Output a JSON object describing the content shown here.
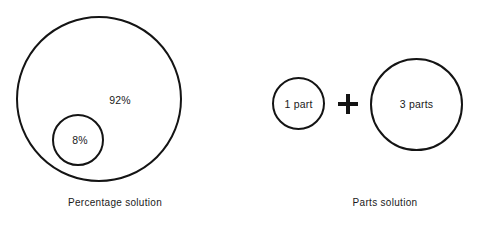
{
  "figure": {
    "width": 485,
    "height": 225,
    "background_color": "#ffffff",
    "stroke_color": "#141414",
    "text_color": "#1a1a1a"
  },
  "chart_data": {
    "type": "diagram",
    "title": "",
    "subtitle": "",
    "xlabel": "",
    "ylabel": "",
    "grid": false,
    "legend_position": "none",
    "panels": [
      {
        "name": "percentage-solution",
        "caption": "Percentage solution",
        "shapes": [
          {
            "name": "solution-outer-circle",
            "label": "92%",
            "value": 92,
            "unit": "%",
            "role": "solvent-plus-solute-whole",
            "center": [
              99,
              99
            ],
            "radius": 83
          },
          {
            "name": "solute-inner-circle",
            "label": "8%",
            "value": 8,
            "unit": "%",
            "role": "solute-part",
            "center": [
              78,
              140
            ],
            "radius": 26
          }
        ]
      },
      {
        "name": "parts-solution",
        "caption": "Parts solution",
        "operator": "+",
        "shapes": [
          {
            "name": "one-part-circle",
            "label": "1 part",
            "value": 1,
            "unit": "part",
            "role": "solute-part",
            "center": [
              298,
              103
            ],
            "radius": 26
          },
          {
            "name": "three-parts-circle",
            "label": "3 parts",
            "value": 3,
            "unit": "parts",
            "role": "solvent-part",
            "center": [
              416,
              104
            ],
            "radius": 46
          }
        ]
      }
    ]
  },
  "percentage_panel": {
    "outer_label": "92%",
    "inner_label": "8%",
    "caption": "Percentage solution"
  },
  "parts_panel": {
    "first_label": "1 part",
    "operator": "+",
    "second_label": "3 parts",
    "caption": "Parts solution"
  }
}
